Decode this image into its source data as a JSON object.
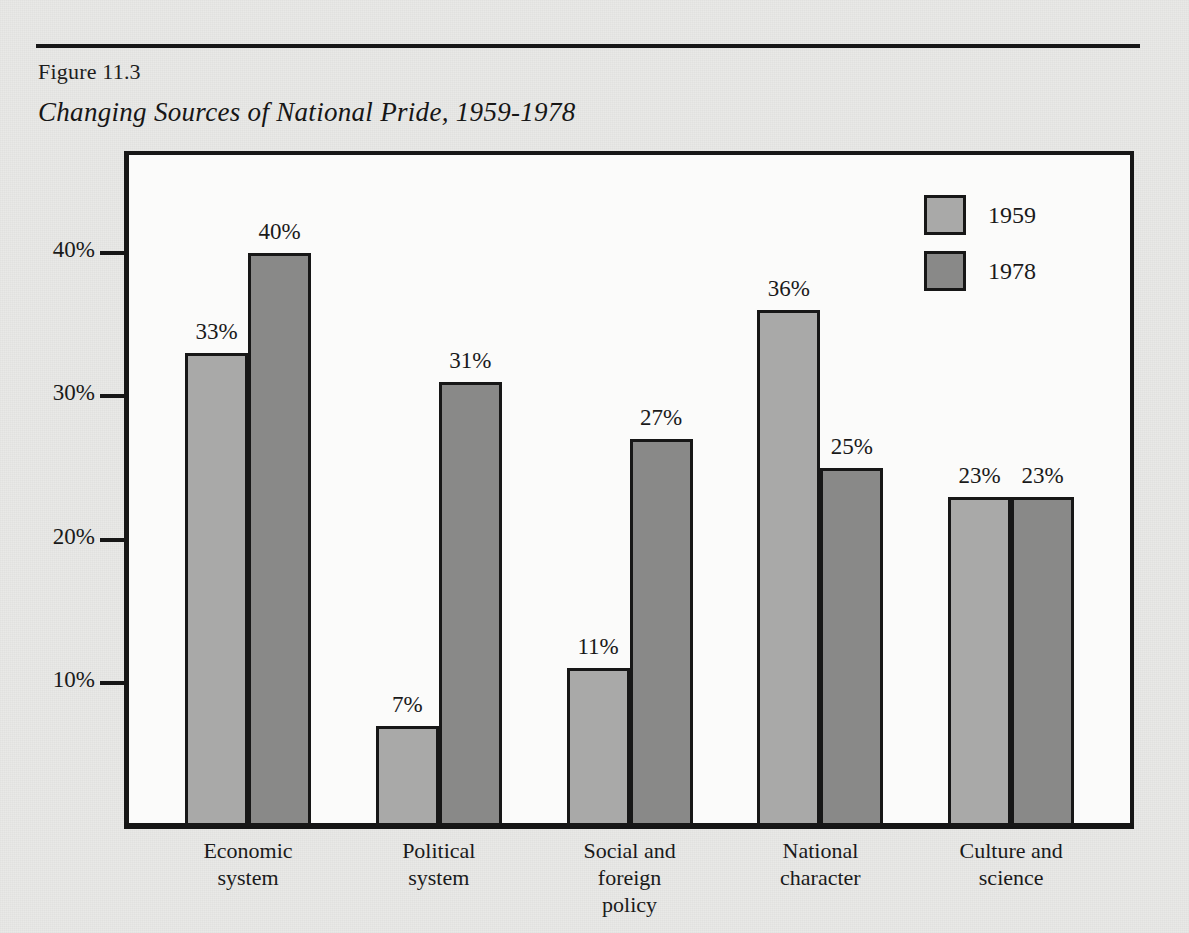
{
  "figure": {
    "number_label": "Figure 11.3",
    "title": "Changing Sources of National Pride, 1959-1978"
  },
  "legend": {
    "position": "top-right",
    "entries": [
      {
        "label": "1959",
        "swatch_name": "legend-swatch-1959",
        "color": "#a9a9a8"
      },
      {
        "label": "1978",
        "swatch_name": "legend-swatch-1978",
        "color": "#898988"
      }
    ]
  },
  "axes": {
    "y_tick_labels": [
      "10%",
      "20%",
      "30%",
      "40%"
    ],
    "y_tick_values": [
      10,
      20,
      30,
      40
    ]
  },
  "chart_data": {
    "type": "bar",
    "title": "Changing Sources of National Pride, 1959-1978",
    "subtitle": "Figure 11.3",
    "xlabel": "",
    "ylabel": "",
    "ylim": [
      0,
      44
    ],
    "grid": false,
    "legend_position": "top-right",
    "value_suffix": "%",
    "categories": [
      "Economic system",
      "Political system",
      "Social and foreign policy",
      "National character",
      "Culture and science"
    ],
    "category_label_lines": [
      [
        "Economic",
        "system"
      ],
      [
        "Political",
        "system"
      ],
      [
        "Social and",
        "foreign",
        "policy"
      ],
      [
        "National",
        "character"
      ],
      [
        "Culture and",
        "science"
      ]
    ],
    "series": [
      {
        "name": "1959",
        "color": "#a9a9a8",
        "values": [
          33,
          7,
          11,
          36,
          23
        ],
        "value_labels": [
          "33%",
          "7%",
          "11%",
          "36%",
          "23%"
        ]
      },
      {
        "name": "1978",
        "color": "#898988",
        "values": [
          40,
          31,
          27,
          25,
          23
        ],
        "value_labels": [
          "40%",
          "31%",
          "27%",
          "25%",
          "23%"
        ]
      }
    ],
    "tick_labels_y": [
      "10%",
      "20%",
      "30%",
      "40%"
    ],
    "axis_color": "#171717",
    "plot_background": "#fbfbfa",
    "page_background": "#e9e9e7"
  }
}
